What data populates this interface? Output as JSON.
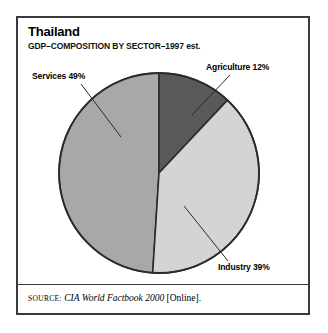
{
  "card": {
    "title": "Thailand",
    "subtitle": "GDP–COMPOSITION BY SECTOR–1997 est.",
    "source": {
      "prefix": "SOURCE:",
      "work": "CIA World Factbook 2000",
      "suffix": "[Online]."
    },
    "border_color": "#3a3a3a",
    "background": "#ffffff"
  },
  "chart_data": {
    "type": "pie",
    "title": "Thailand",
    "subtitle": "GDP–COMPOSITION BY SECTOR–1997 est.",
    "categories": [
      "Agriculture",
      "Industry",
      "Services"
    ],
    "values": [
      12,
      39,
      49
    ],
    "unit": "%",
    "labels": [
      "Agriculture 12%",
      "Industry 39%",
      "Services 49%"
    ],
    "colors": [
      "#595959",
      "#d4d4d4",
      "#a8a8a8"
    ],
    "start_angle_deg": 0,
    "direction": "clockwise",
    "legend": "callout-labels",
    "grid": false,
    "outline_color": "#2b2b2b",
    "center": {
      "x": 157,
      "y": 171
    },
    "radius": 100
  },
  "slices": {
    "agriculture": {
      "label": "Agriculture 12%",
      "name": "Agriculture",
      "value": 12,
      "color": "#595959"
    },
    "industry": {
      "label": "Industry 39%",
      "name": "Industry",
      "value": 39,
      "color": "#d4d4d4"
    },
    "services": {
      "label": "Services 49%",
      "name": "Services",
      "value": 49,
      "color": "#a8a8a8"
    }
  }
}
